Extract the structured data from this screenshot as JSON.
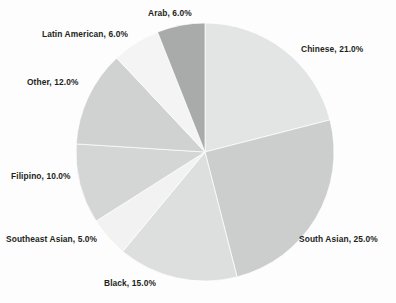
{
  "chart_data": {
    "type": "pie",
    "title": "",
    "subtitle": "",
    "xlabel": "",
    "ylabel": "",
    "legend_position": "none",
    "grid": false,
    "label_format": "{name}, {value}%",
    "start_angle_deg": 0,
    "direction": "clockwise",
    "categories": [
      "Chinese",
      "South Asian",
      "Black",
      "Southeast Asian",
      "Filipino",
      "Other",
      "Latin American",
      "Arab"
    ],
    "values": [
      21.0,
      25.0,
      15.0,
      5.0,
      10.0,
      12.0,
      6.0,
      6.0
    ],
    "total": 100.0,
    "slices": [
      {
        "name": "Chinese",
        "value": 21.0,
        "label": "Chinese, 21.0%",
        "color": "#e3e4e4"
      },
      {
        "name": "South Asian",
        "value": 25.0,
        "label": "South Asian, 25.0%",
        "color": "#cccdcd"
      },
      {
        "name": "Black",
        "value": 15.0,
        "label": "Black, 15.0%",
        "color": "#dddede"
      },
      {
        "name": "Southeast Asian",
        "value": 5.0,
        "label": "Southeast Asian, 5.0%",
        "color": "#f2f2f2"
      },
      {
        "name": "Filipino",
        "value": 10.0,
        "label": "Filipino, 10.0%",
        "color": "#d4d5d5"
      },
      {
        "name": "Other",
        "value": 12.0,
        "label": "Other, 12.0%",
        "color": "#d0d1d1"
      },
      {
        "name": "Latin American",
        "value": 6.0,
        "label": "Latin American, 6.0%",
        "color": "#f4f4f4"
      },
      {
        "name": "Arab",
        "value": 6.0,
        "label": "Arab, 6.0%",
        "color": "#a9abab"
      }
    ],
    "colors": {
      "background": "#fdfdfd",
      "label_text": "#231f20",
      "slice_edge": "#ffffff"
    },
    "geometry": {
      "cx": 205,
      "cy": 152,
      "r": 129
    }
  }
}
